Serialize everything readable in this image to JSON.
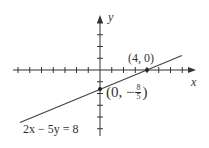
{
  "figure": {
    "equation": "2x − 5y = 8",
    "axis_labels": {
      "x": "x",
      "y": "y"
    },
    "points": [
      {
        "label": "(4, 0)",
        "x": 4,
        "y": 0
      },
      {
        "label_prefix": "(0, −",
        "frac_num": "8",
        "frac_den": "5",
        "label_suffix": ")",
        "x": 0,
        "y": -1.6
      }
    ],
    "colors": {
      "line": "#444444",
      "axis": "#333333",
      "text": "#333333"
    }
  }
}
